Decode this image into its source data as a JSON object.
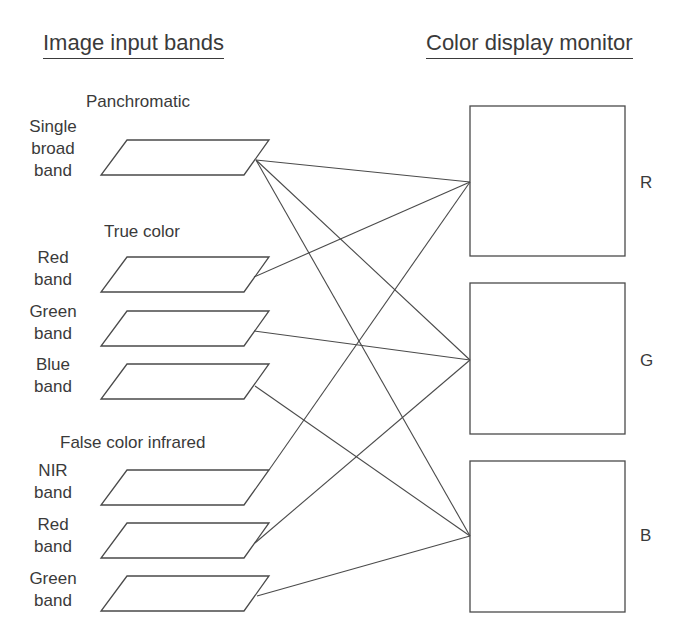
{
  "headers": {
    "left": "Image input bands",
    "right": "Color display monitor"
  },
  "groups": [
    {
      "label": "Panchromatic"
    },
    {
      "label": "True color"
    },
    {
      "label": "False color infrared"
    }
  ],
  "bands": [
    {
      "line1": "Single",
      "line2": "broad",
      "line3": "band",
      "group": "Panchromatic",
      "connects_to": [
        "R",
        "G",
        "B"
      ]
    },
    {
      "line1": "Red",
      "line2": "band",
      "group": "True color",
      "connects_to": [
        "R"
      ]
    },
    {
      "line1": "Green",
      "line2": "band",
      "group": "True color",
      "connects_to": [
        "G"
      ]
    },
    {
      "line1": "Blue",
      "line2": "band",
      "group": "True color",
      "connects_to": [
        "B"
      ]
    },
    {
      "line1": "NIR",
      "line2": "band",
      "group": "False color infrared",
      "connects_to": [
        "R"
      ]
    },
    {
      "line1": "Red",
      "line2": "band",
      "group": "False color infrared",
      "connects_to": [
        "G"
      ]
    },
    {
      "line1": "Green",
      "line2": "band",
      "group": "False color infrared",
      "connects_to": [
        "B"
      ]
    }
  ],
  "channels": [
    {
      "label": "R"
    },
    {
      "label": "G"
    },
    {
      "label": "B"
    }
  ],
  "colors": {
    "line": "#4a4a4a",
    "text": "#3a3a3a",
    "background": "#ffffff"
  }
}
